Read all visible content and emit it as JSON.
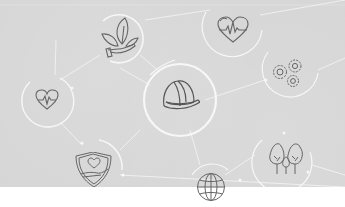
{
  "illustration": {
    "background_color": "#d6d6d6",
    "below_color": "#ffffff",
    "line_color": "#f4f4f4",
    "icon_stroke": "#6a6a6a",
    "nodes": [
      {
        "id": "plant-in-hand",
        "icon": "plant-hand-icon",
        "cx": 120,
        "cy": 38,
        "r": 24
      },
      {
        "id": "heart-pulse-top",
        "icon": "heart-pulse-icon",
        "cx": 232,
        "cy": 30,
        "r": 30
      },
      {
        "id": "gears",
        "icon": "gears-icon",
        "cx": 290,
        "cy": 73,
        "r": 28
      },
      {
        "id": "hard-hat",
        "icon": "hard-hat-icon",
        "cx": 180,
        "cy": 100,
        "r": 36
      },
      {
        "id": "heart-pulse-left",
        "icon": "heart-pulse-icon",
        "cx": 47,
        "cy": 100,
        "r": 26
      },
      {
        "id": "heart-shield",
        "icon": "shield-heart-icon",
        "cx": 95,
        "cy": 168,
        "r": 28
      },
      {
        "id": "trees",
        "icon": "trees-icon",
        "cx": 285,
        "cy": 158,
        "r": 30
      },
      {
        "id": "globe",
        "icon": "globe-icon",
        "cx": 211,
        "cy": 186,
        "r": 24
      }
    ]
  }
}
